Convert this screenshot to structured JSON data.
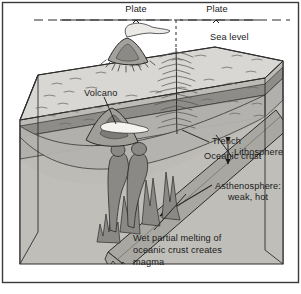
{
  "diagram": {
    "frame_color": "#3a3a3a",
    "background": "#ffffff"
  },
  "palette": {
    "ocean_top": "#d8d6d2",
    "ocean_top_far": "#cfcdc8",
    "side_face": "#c6c4bf",
    "crust_band": "#9b9a96",
    "lithosphere_band": "#b0aeaa",
    "asthenosphere": "#bdbbb6",
    "slab": "#a9a7a2",
    "volcano_dark": "#8e8c88",
    "ink": "#1a1a1a"
  },
  "labels": {
    "plate_left": "Plate",
    "plate_right": "Plate",
    "sea_level": "Sea level",
    "volcano": "Volcano",
    "trench": "Trench",
    "oceanic_crust": "Oceanic crust",
    "lithosphere": "Lithosphere",
    "asthenosphere_line1": "Asthenosphere:",
    "asthenosphere_line2": "weak, hot",
    "melting_line1": "Wet partial melting of",
    "melting_line2": "oceanic crust creates",
    "melting_line3": "magma"
  },
  "annotations": {
    "plate_motion_left_direction": "right",
    "plate_motion_right_direction": "left",
    "subduction_arrow_direction": "down-left",
    "lithosphere_thickness_arrow": "double-headed-vertical",
    "trench_marker": "feathered-vertical-line"
  }
}
